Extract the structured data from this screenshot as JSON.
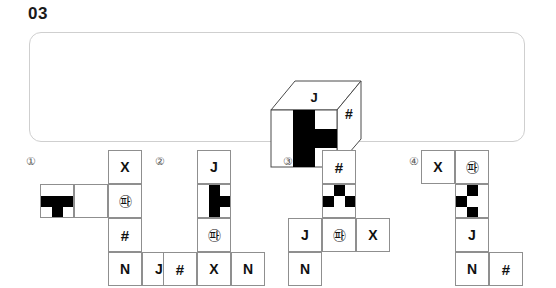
{
  "question": {
    "number": "03"
  },
  "stimulus": {
    "cube": {
      "top_face_label": "J",
      "right_face_label": "#",
      "front_face_pattern": {
        "rows": 3,
        "cols": 3,
        "filled": [
          [
            0,
            1
          ],
          [
            1,
            1
          ],
          [
            1,
            2
          ],
          [
            2,
            1
          ]
        ],
        "fill_color": "#000000",
        "background_color": "#ffffff"
      }
    }
  },
  "options": [
    {
      "label": "①",
      "name": "option-1",
      "cells": [
        {
          "kind": "text",
          "value": "X",
          "col": 2,
          "row": 0
        },
        {
          "kind": "pattern",
          "value": "",
          "col": 0,
          "row": 1,
          "filled": [
            [
              1,
              0
            ],
            [
              1,
              1
            ],
            [
              1,
              2
            ],
            [
              2,
              1
            ]
          ]
        },
        {
          "kind": "blank",
          "value": "",
          "col": 1,
          "row": 1
        },
        {
          "kind": "text",
          "value": "㉺",
          "col": 2,
          "row": 1
        },
        {
          "kind": "text",
          "value": "#",
          "col": 2,
          "row": 2
        },
        {
          "kind": "text",
          "value": "N",
          "col": 2,
          "row": 3
        },
        {
          "kind": "text",
          "value": "J",
          "col": 3,
          "row": 3
        }
      ]
    },
    {
      "label": "②",
      "name": "option-2",
      "cells": [
        {
          "kind": "text",
          "value": "J",
          "col": 1,
          "row": 0
        },
        {
          "kind": "pattern",
          "value": "",
          "col": 1,
          "row": 1,
          "filled": [
            [
              0,
              1
            ],
            [
              1,
              1
            ],
            [
              1,
              2
            ],
            [
              2,
              1
            ]
          ]
        },
        {
          "kind": "text",
          "value": "㉺",
          "col": 1,
          "row": 2
        },
        {
          "kind": "text",
          "value": "#",
          "col": 0,
          "row": 3
        },
        {
          "kind": "text",
          "value": "X",
          "col": 1,
          "row": 3
        },
        {
          "kind": "text",
          "value": "N",
          "col": 2,
          "row": 3
        }
      ]
    },
    {
      "label": "③",
      "name": "option-3",
      "cells": [
        {
          "kind": "text",
          "value": "#",
          "col": 1,
          "row": 0
        },
        {
          "kind": "pattern",
          "value": "",
          "col": 1,
          "row": 1,
          "filled": [
            [
              0,
              1
            ],
            [
              1,
              0
            ],
            [
              1,
              2
            ]
          ]
        },
        {
          "kind": "text",
          "value": "J",
          "col": 0,
          "row": 2
        },
        {
          "kind": "text",
          "value": "㉺",
          "col": 1,
          "row": 2
        },
        {
          "kind": "text",
          "value": "X",
          "col": 2,
          "row": 2
        },
        {
          "kind": "text",
          "value": "N",
          "col": 0,
          "row": 3
        }
      ]
    },
    {
      "label": "④",
      "name": "option-4",
      "cells": [
        {
          "kind": "text",
          "value": "X",
          "col": 0,
          "row": 0
        },
        {
          "kind": "text",
          "value": "㉺",
          "col": 1,
          "row": 0
        },
        {
          "kind": "pattern",
          "value": "",
          "col": 1,
          "row": 1,
          "filled": [
            [
              0,
              1
            ],
            [
              1,
              0
            ],
            [
              2,
              1
            ]
          ]
        },
        {
          "kind": "text",
          "value": "J",
          "col": 1,
          "row": 2
        },
        {
          "kind": "text",
          "value": "N",
          "col": 1,
          "row": 3
        },
        {
          "kind": "text",
          "value": "#",
          "col": 2,
          "row": 3
        }
      ]
    }
  ],
  "layout": {
    "option_origins": [
      {
        "label_x": 26,
        "label_y": 6,
        "net_x": 40,
        "net_y": 0
      },
      {
        "label_x": 155,
        "label_y": 6,
        "net_x": 163,
        "net_y": 0
      },
      {
        "label_x": 283,
        "label_y": 6,
        "net_x": 288,
        "net_y": 0
      },
      {
        "label_x": 409,
        "label_y": 6,
        "net_x": 421,
        "net_y": 0
      }
    ],
    "cell_size": 34
  },
  "colors": {
    "panel_border": "#cfcfcf",
    "cell_border": "#8f8f8f",
    "ink": "#111111",
    "fill": "#000000",
    "background": "#ffffff"
  }
}
